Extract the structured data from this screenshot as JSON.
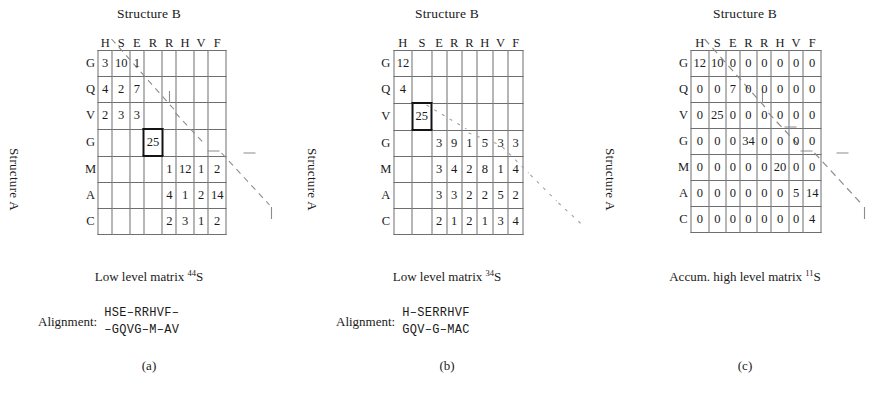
{
  "panels": [
    {
      "id": "a",
      "title": "Structure B",
      "row_axis_label": "Structure A",
      "col_headers": [
        "H",
        "S",
        "E",
        "R",
        "R",
        "H",
        "V",
        "F"
      ],
      "row_headers": [
        "G",
        "Q",
        "V",
        "G",
        "M",
        "A",
        "C"
      ],
      "cells": [
        [
          "3",
          "10",
          "1",
          "",
          "",
          "",
          "",
          ""
        ],
        [
          "4",
          "2",
          "7",
          "",
          "",
          "",
          "",
          ""
        ],
        [
          "2",
          "3",
          "3",
          "",
          "",
          "",
          "",
          ""
        ],
        [
          "",
          "",
          "",
          "25",
          "",
          "",
          "",
          ""
        ],
        [
          "",
          "",
          "",
          "",
          "1",
          "12",
          "1",
          "2"
        ],
        [
          "",
          "",
          "",
          "",
          "4",
          "1",
          "2",
          "14"
        ],
        [
          "",
          "",
          "",
          "",
          "2",
          "3",
          "1",
          "2"
        ]
      ],
      "boxed_cell": {
        "row": 3,
        "col": 3
      },
      "caption": "Low level matrix",
      "caption_sup": "44",
      "caption_sym": "S",
      "alignment_label": "Alignment:",
      "alignment_top": "HSE–RRHVF–",
      "alignment_bottom": "–GQVG–M–AV",
      "subfig_label": "(a)"
    },
    {
      "id": "b",
      "title": "Structure B",
      "row_axis_label": "Structure A",
      "col_headers": [
        "H",
        "S",
        "E",
        "R",
        "R",
        "H",
        "V",
        "F"
      ],
      "row_headers": [
        "G",
        "Q",
        "V",
        "G",
        "M",
        "A",
        "C"
      ],
      "cells": [
        [
          "12",
          "",
          "",
          "",
          "",
          "",
          "",
          ""
        ],
        [
          "4",
          "",
          "",
          "",
          "",
          "",
          "",
          ""
        ],
        [
          "",
          "25",
          "",
          "",
          "",
          "",
          "",
          ""
        ],
        [
          "",
          "",
          "3",
          "9",
          "1",
          "5",
          "3",
          "3"
        ],
        [
          "",
          "",
          "3",
          "4",
          "2",
          "8",
          "1",
          "4"
        ],
        [
          "",
          "",
          "3",
          "3",
          "2",
          "2",
          "5",
          "2"
        ],
        [
          "",
          "",
          "2",
          "1",
          "2",
          "1",
          "3",
          "4"
        ]
      ],
      "boxed_cell": {
        "row": 2,
        "col": 1
      },
      "caption": "Low level matrix",
      "caption_sup": "34",
      "caption_sym": "S",
      "alignment_label": "Alignment:",
      "alignment_top": "H–SERRHVF",
      "alignment_bottom": "GQV–G–MAC",
      "subfig_label": "(b)"
    },
    {
      "id": "c",
      "title": "Structure B",
      "row_axis_label": "Structure A",
      "col_headers": [
        "H",
        "S",
        "E",
        "R",
        "R",
        "H",
        "V",
        "F"
      ],
      "row_headers": [
        "G",
        "Q",
        "V",
        "G",
        "M",
        "A",
        "C"
      ],
      "cells": [
        [
          "12",
          "10",
          "0",
          "0",
          "0",
          "0",
          "0",
          "0"
        ],
        [
          "0",
          "0",
          "7",
          "0",
          "0",
          "0",
          "0",
          "0"
        ],
        [
          "0",
          "25",
          "0",
          "0",
          "0",
          "0",
          "0",
          "0"
        ],
        [
          "0",
          "0",
          "0",
          "34",
          "0",
          "0",
          "0",
          "0"
        ],
        [
          "0",
          "0",
          "0",
          "0",
          "0",
          "20",
          "0",
          "0"
        ],
        [
          "0",
          "0",
          "0",
          "0",
          "0",
          "0",
          "5",
          "14"
        ],
        [
          "0",
          "0",
          "0",
          "0",
          "0",
          "0",
          "0",
          "4"
        ]
      ],
      "boxed_cell": null,
      "caption": "Accum. high level matrix",
      "caption_sup": "11",
      "caption_sym": "S",
      "alignment_label": "",
      "alignment_top": "",
      "alignment_bottom": "",
      "subfig_label": "(c)"
    }
  ],
  "style": {
    "grid_line_color": "#6e6e6e",
    "box_color": "#141414",
    "dash_color": "#8c8c8c",
    "text_color": "#1a1a1a"
  }
}
